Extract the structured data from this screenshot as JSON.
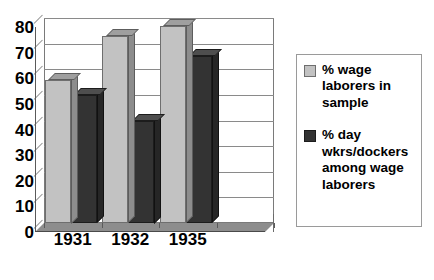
{
  "chart_data": {
    "type": "bar",
    "title": "",
    "subtitle": "",
    "xlabel": "",
    "ylabel": "",
    "categories": [
      "1931",
      "1932",
      "1935",
      ""
    ],
    "series": [
      {
        "name": "% wage laborers in sample",
        "color": "#c2c2c2",
        "values": [
          56,
          73,
          77,
          null
        ]
      },
      {
        "name": "% day wkrs/dockers among wage laborers",
        "color": "#333333",
        "values": [
          50,
          40,
          65,
          null
        ]
      }
    ],
    "ylim": [
      0,
      80
    ],
    "ytick_step": 10,
    "yticks": [
      "80",
      "70",
      "60",
      "50",
      "40",
      "30",
      "20",
      "10",
      "0"
    ],
    "ytick_values": [
      80,
      70,
      60,
      50,
      40,
      30,
      20,
      10,
      0
    ],
    "grid": true,
    "legend_position": "right",
    "style_3d": true
  },
  "legend": {
    "entries": [
      {
        "swatch": "light-gray-swatch",
        "label": "% wage laborers in sample"
      },
      {
        "swatch": "dark-gray-swatch",
        "label": "% day wkrs/dockers among wage laborers"
      }
    ]
  },
  "colors": {
    "series_light": "#c2c2c2",
    "series_dark": "#333333",
    "grid": "#8a8a8a",
    "axis": "#5a5a5a",
    "floor": "#8d8d8d",
    "background": "#ffffff"
  }
}
